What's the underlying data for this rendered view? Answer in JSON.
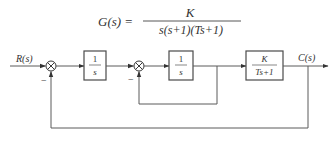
{
  "formula": {
    "lhs": "G(s) =",
    "numerator": "K",
    "denominator": "s(s+1)(Ts+1)"
  },
  "signals": {
    "input": "R(s)",
    "output": "C(s)"
  },
  "blocks": [
    {
      "id": "integrator-1",
      "numerator": "1",
      "denominator": "s"
    },
    {
      "id": "integrator-2",
      "numerator": "1",
      "denominator": "s"
    },
    {
      "id": "plant",
      "numerator": "K",
      "denominator": "Ts+1"
    }
  ],
  "summing_junctions": [
    {
      "id": "sum-1",
      "feedback_sign": "−"
    },
    {
      "id": "sum-2",
      "feedback_sign": "−"
    }
  ],
  "colors": {
    "line": "#5a5a5a",
    "text": "#333333",
    "background": "#ffffff"
  }
}
